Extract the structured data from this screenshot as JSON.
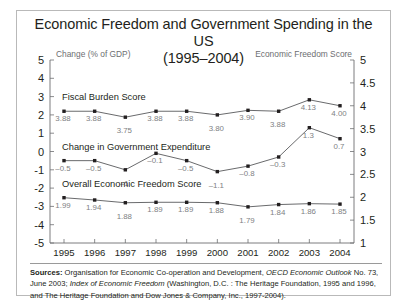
{
  "figure": {
    "title_line1": "Economic Freedom and Government Spending in the US",
    "title_line2": "(1995–2004)",
    "left_axis_caption": "Change (% of GDP)",
    "right_axis_caption": "Economic Freedom Score",
    "sources_label": "Sources:",
    "sources_text_1": " Organisation for Economic Co-operation and Development, ",
    "sources_italic_1": "OECD Economic Outlook",
    "sources_text_2": " No. 73, June 2003; ",
    "sources_italic_2": "Index of Economic Freedom",
    "sources_text_3": " (Washington, D.C. : The Heritage Foundation, 1995 and 1996, and The Heritage Foundation and Dow Jones & Company, Inc., 1997-2004)."
  },
  "chart_data": {
    "type": "line",
    "title": "Economic Freedom and Government Spending in the US (1995–2004)",
    "xlabel": "",
    "ylabel": "Change (% of GDP)",
    "y2label": "Economic Freedom Score",
    "categories": [
      "1995",
      "1996",
      "1997",
      "1998",
      "1999",
      "2000",
      "2001",
      "2002",
      "2003",
      "2004"
    ],
    "x_tick_labels": [
      "1995",
      "1996",
      "1997",
      "1998",
      "1999",
      "2000",
      "2001",
      "2002",
      "2003",
      "2004"
    ],
    "left_axis_ticks": [
      "5",
      "4",
      "3",
      "2",
      "1",
      "0",
      "-1",
      "-2",
      "-3",
      "-4",
      "-5"
    ],
    "left_axis_values": [
      5,
      4,
      3,
      2,
      1,
      0,
      -1,
      -2,
      -3,
      -4,
      -5
    ],
    "right_axis_ticks": [
      "5",
      "4.5",
      "4",
      "3.5",
      "3",
      "2.5",
      "2",
      "1.5",
      "1"
    ],
    "right_axis_values": [
      5,
      4.5,
      4,
      3.5,
      3,
      2.5,
      2,
      1.5,
      1
    ],
    "ylim": [
      -5,
      5
    ],
    "y2lim": [
      1,
      5
    ],
    "grid": false,
    "legend": "inline-series-labels",
    "series": [
      {
        "name": "Fiscal Burden Score",
        "axis": "right",
        "values": [
          3.88,
          3.88,
          3.75,
          3.88,
          3.88,
          3.8,
          3.9,
          3.88,
          4.13,
          4.0
        ],
        "labels": [
          "3.88",
          "3.88",
          "3.75",
          "3.88",
          "3.88",
          "3.80",
          "3.90",
          "3.88",
          "4.13",
          "4.00"
        ]
      },
      {
        "name": "Change in Government Expenditure",
        "axis": "left",
        "values": [
          -0.5,
          -0.5,
          -1.0,
          -0.1,
          -0.5,
          -1.1,
          -0.8,
          -0.3,
          1.3,
          0.7
        ],
        "labels": [
          "–0.5",
          "–0.5",
          "–1",
          "–0.1",
          "–0.5",
          "–1.1",
          "–0.8",
          "–0.3",
          "1.3",
          "0.7"
        ]
      },
      {
        "name": "Overall Economic Freedom Score",
        "axis": "right",
        "values": [
          1.99,
          1.94,
          1.88,
          1.89,
          1.89,
          1.88,
          1.79,
          1.84,
          1.86,
          1.85
        ],
        "labels": [
          "1.99",
          "1.94",
          "1.88",
          "1.89",
          "1.89",
          "1.88",
          "1.79",
          "1.84",
          "1.86",
          "1.85"
        ]
      }
    ],
    "colors": {
      "line": "#58595b",
      "marker": "#231f20",
      "axis": "#6d6e71",
      "point_label": "#808184",
      "text": "#231f20"
    }
  }
}
